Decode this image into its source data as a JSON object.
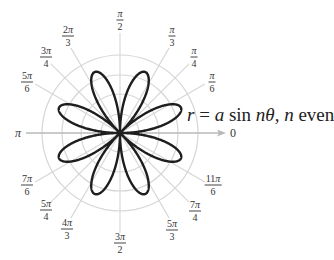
{
  "figure": {
    "equation": {
      "r": "r",
      "eq": " = ",
      "a": "a",
      "sin": " sin ",
      "n_theta": "nθ",
      "comma": ", ",
      "n": "n",
      "even": " even"
    },
    "center": [
      120,
      133
    ],
    "grid_radii": [
      19,
      39,
      58,
      78
    ],
    "petal_radius": 66,
    "rose_n": 4,
    "colors": {
      "grid": "#d6d6d6",
      "axis": "#b9b9b9",
      "curve": "#1e1e1e",
      "label": "#333333"
    },
    "axis_labels": {
      "zero": "0",
      "pi": "π"
    },
    "angle_labels": [
      {
        "name": "pi-over-2",
        "num": "π",
        "den": "2",
        "x": 120,
        "y": 20
      },
      {
        "name": "pi-over-3",
        "num": "π",
        "den": "3",
        "x": 172,
        "y": 36
      },
      {
        "name": "pi-over-4",
        "num": "π",
        "den": "4",
        "x": 194,
        "y": 57
      },
      {
        "name": "pi-over-6",
        "num": "π",
        "den": "6",
        "x": 212,
        "y": 82
      },
      {
        "name": "2pi-over-3",
        "num": "2π",
        "den": "3",
        "x": 68,
        "y": 36
      },
      {
        "name": "3pi-over-4",
        "num": "3π",
        "den": "4",
        "x": 46,
        "y": 57
      },
      {
        "name": "5pi-over-6",
        "num": "5π",
        "den": "6",
        "x": 27,
        "y": 82
      },
      {
        "name": "7pi-over-6",
        "num": "7π",
        "den": "6",
        "x": 27,
        "y": 185
      },
      {
        "name": "5pi-over-4",
        "num": "5π",
        "den": "4",
        "x": 46,
        "y": 210
      },
      {
        "name": "4pi-over-3",
        "num": "4π",
        "den": "3",
        "x": 67,
        "y": 229
      },
      {
        "name": "3pi-over-2",
        "num": "3π",
        "den": "2",
        "x": 120,
        "y": 243
      },
      {
        "name": "5pi-over-3",
        "num": "5π",
        "den": "3",
        "x": 172,
        "y": 230
      },
      {
        "name": "7pi-over-4",
        "num": "7π",
        "den": "4",
        "x": 195,
        "y": 211
      },
      {
        "name": "11pi-over-6",
        "num": "11π",
        "den": "6",
        "x": 213,
        "y": 185
      }
    ]
  }
}
